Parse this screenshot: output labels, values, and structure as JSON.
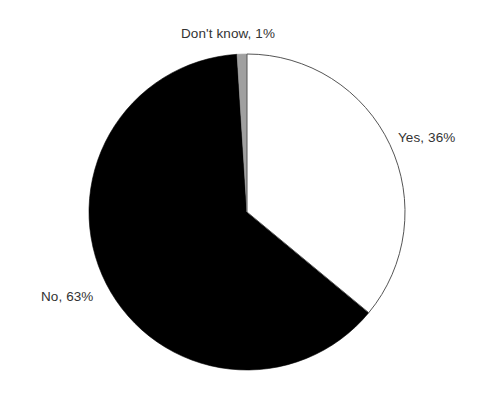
{
  "chart_data": {
    "type": "pie",
    "title": "",
    "subtitle": "",
    "xlabel": "",
    "ylabel": "",
    "legend_position": "none",
    "grid": false,
    "labels_inline": true,
    "start_angle_deg": 0,
    "direction": "clockwise",
    "categories": [
      "Yes",
      "No",
      "Don't know"
    ],
    "values": [
      36,
      63,
      1
    ],
    "value_unit": "%",
    "slices": [
      {
        "name": "Yes",
        "value": 36,
        "label": "Yes, 36%",
        "color": "#ffffff",
        "edge_color": "#555555",
        "start_deg": 0,
        "end_deg": 129.6
      },
      {
        "name": "No",
        "value": 63,
        "label": "No, 63%",
        "color": "#000000",
        "edge_color": "#000000",
        "start_deg": 129.6,
        "end_deg": 356.4
      },
      {
        "name": "Don't know",
        "value": 1,
        "label": "Don't know, 1%",
        "color": "#a0a0a0",
        "edge_color": "#a0a0a0",
        "start_deg": 356.4,
        "end_deg": 360
      }
    ],
    "annotations": [
      {
        "text": "Don't know, 1%",
        "position": "top-center"
      },
      {
        "text": "Yes, 36%",
        "position": "right"
      },
      {
        "text": "No, 63%",
        "position": "left"
      }
    ]
  },
  "geometry": {
    "center_x": 247,
    "center_y": 212,
    "radius": 158
  },
  "colors": {
    "background": "#ffffff",
    "text": "#333333",
    "yes_fill": "#ffffff",
    "yes_stroke": "#555555",
    "no_fill": "#000000",
    "dontknow_fill": "#a0a0a0"
  }
}
